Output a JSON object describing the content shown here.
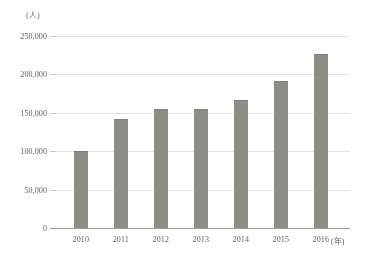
{
  "chart_data": {
    "type": "bar",
    "title": "",
    "xlabel": "(年)",
    "ylabel": "(人)",
    "categories": [
      "2010",
      "2011",
      "2012",
      "2013",
      "2014",
      "2015",
      "2016"
    ],
    "values": [
      100000,
      142000,
      155000,
      155000,
      167000,
      192000,
      227000
    ],
    "ylim": [
      0,
      250000
    ],
    "ytick_values": [
      0,
      50000,
      100000,
      150000,
      200000,
      250000
    ],
    "ytick_labels": [
      "0",
      "50,000",
      "100,000",
      "150,000",
      "200,000",
      "250,000"
    ],
    "grid": true,
    "legend": false,
    "series": [
      {
        "name": "",
        "values": [
          100000,
          142000,
          155000,
          155000,
          167000,
          192000,
          227000
        ]
      }
    ]
  },
  "style": {
    "bar_color": "#8d8d86",
    "gridline_color": "#e3e1dd",
    "axis_color": "#9a9a92",
    "text_color": "#5a5a55",
    "background": "#ffffff"
  }
}
